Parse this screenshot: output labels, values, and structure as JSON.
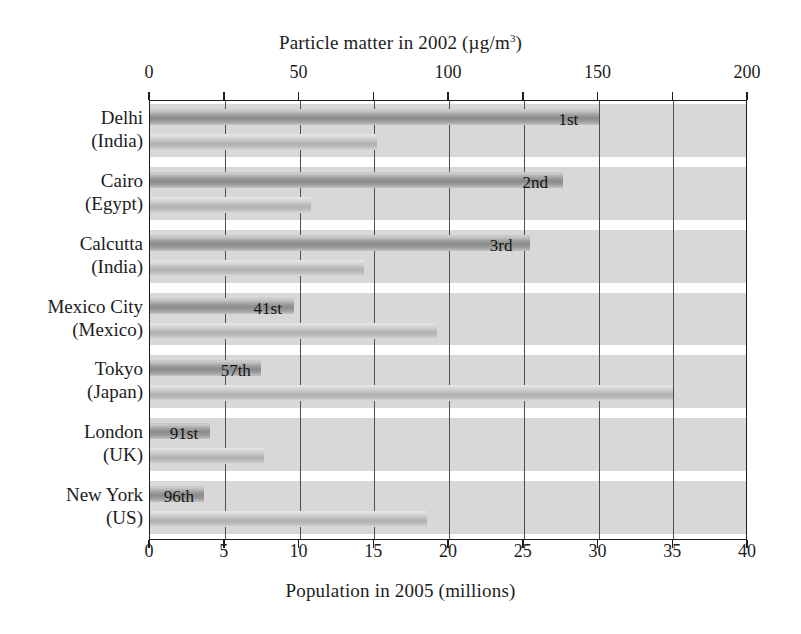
{
  "chart_data": {
    "type": "bar",
    "orientation": "horizontal",
    "title": "",
    "categories": [
      {
        "city": "Delhi",
        "country": "(India)"
      },
      {
        "city": "Cairo",
        "country": "(Egypt)"
      },
      {
        "city": "Calcutta",
        "country": "(India)"
      },
      {
        "city": "Mexico City",
        "country": "(Mexico)"
      },
      {
        "city": "Tokyo",
        "country": "(Japan)"
      },
      {
        "city": "London",
        "country": "(UK)"
      },
      {
        "city": "New York",
        "country": "(US)"
      }
    ],
    "series": [
      {
        "name": "Pollution levels",
        "axis": "top",
        "unit": "µg/m³",
        "values": [
          150,
          138,
          127,
          48,
          37,
          20,
          18
        ]
      },
      {
        "name": "Population levels",
        "axis": "bottom",
        "unit": "millions",
        "values": [
          15.2,
          10.8,
          14.3,
          19.2,
          35.0,
          7.6,
          18.5
        ]
      }
    ],
    "rank_labels": [
      "1st",
      "2nd",
      "3rd",
      "41st",
      "57th",
      "91st",
      "96th"
    ],
    "top_axis": {
      "label": "Particle matter in 2002 (µg/m³)",
      "label_prefix": "Particle matter in 2002 (µg/m",
      "label_sup": "3",
      "label_suffix": ")",
      "ticks": [
        "0",
        "50",
        "100",
        "150",
        "200"
      ],
      "tick_values": [
        0,
        50,
        100,
        150,
        200
      ],
      "min": 0,
      "max": 200,
      "gridline_values": [
        0,
        25,
        50,
        75,
        100,
        125,
        150,
        175,
        200
      ]
    },
    "bottom_axis": {
      "label": "Population in 2005 (millions)",
      "ticks": [
        "0",
        "5",
        "10",
        "15",
        "20",
        "25",
        "30",
        "35",
        "40"
      ],
      "tick_values": [
        0,
        5,
        10,
        15,
        20,
        25,
        30,
        35,
        40
      ],
      "min": 0,
      "max": 40,
      "gridline_values": [
        0,
        5,
        10,
        15,
        20,
        25,
        30,
        35,
        40
      ]
    },
    "legend": {
      "position": "inside-lower-right",
      "entries": [
        "Pollution levels",
        "Population levels"
      ]
    },
    "grid": true,
    "colors": {
      "pollution": "#8a8a8a",
      "population": "#bdbdbd",
      "band": "#d8d8d8",
      "axis": "#1c1c1c",
      "gridline": "#4e4e4e",
      "background": "#ffffff"
    }
  }
}
